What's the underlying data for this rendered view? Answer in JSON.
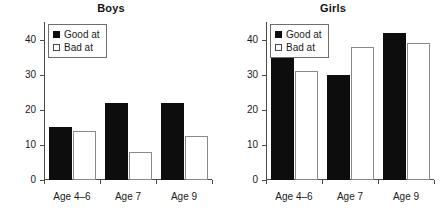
{
  "chart_data": [
    {
      "type": "bar",
      "title": "Boys",
      "categories": [
        "Age 4–6",
        "Age 7",
        "Age 9"
      ],
      "series": [
        {
          "name": "Good at",
          "values": [
            15,
            22,
            22
          ],
          "color": "#0d0d0d"
        },
        {
          "name": "Bad at",
          "values": [
            14,
            8,
            12.5
          ],
          "color": "#ffffff"
        }
      ],
      "xlabel": "",
      "ylabel": "",
      "ylim": [
        0,
        45
      ],
      "yticks": [
        0,
        10,
        20,
        30,
        40
      ],
      "ytick_labels": [
        "0",
        "10",
        "20",
        "30",
        "40"
      ],
      "grid": false,
      "legend_position": "upper left"
    },
    {
      "type": "bar",
      "title": "Girls",
      "categories": [
        "Age 4–6",
        "Age 7",
        "Age 9"
      ],
      "series": [
        {
          "name": "Good at",
          "values": [
            35,
            30,
            42
          ],
          "color": "#0d0d0d"
        },
        {
          "name": "Bad at",
          "values": [
            31,
            38,
            39
          ],
          "color": "#ffffff"
        }
      ],
      "xlabel": "",
      "ylabel": "",
      "ylim": [
        0,
        45
      ],
      "yticks": [
        0,
        10,
        20,
        30,
        40
      ],
      "ytick_labels": [
        "0",
        "10",
        "20",
        "30",
        "40"
      ],
      "grid": false,
      "legend_position": "upper left"
    }
  ]
}
